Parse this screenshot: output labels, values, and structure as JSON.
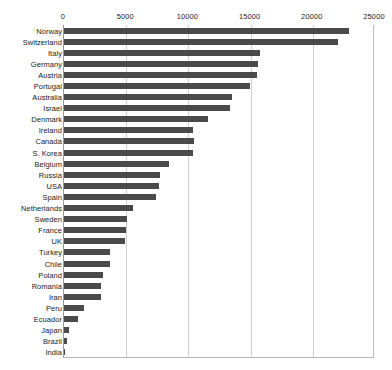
{
  "chart_data": {
    "type": "bar",
    "orientation": "horizontal",
    "title": "",
    "xlabel": "",
    "ylabel": "",
    "xlim": [
      0,
      25000
    ],
    "xticks": [
      0,
      5000,
      10000,
      15000,
      20000,
      25000
    ],
    "xtick_labels": [
      "0",
      "5000",
      "10000",
      "15000",
      "20000",
      "25000"
    ],
    "grid": true,
    "legend": false,
    "bar_color": "#4a4a4a",
    "background_color": "#ffffff",
    "gridline_color": "#cfcfcf",
    "categories": [
      "Norway",
      "Switzerland",
      "Italy",
      "Germany",
      "Austria",
      "Portugal",
      "Australia",
      "Israel",
      "Denmark",
      "Ireland",
      "Canada",
      "S. Korea",
      "Belgium",
      "Russia",
      "USA",
      "Spain",
      "Netherlands",
      "Sweden",
      "France",
      "UK",
      "Turkey",
      "Chile",
      "Poland",
      "Romania",
      "Iran",
      "Peru",
      "Ecuador",
      "Japan",
      "Brazil",
      "India"
    ],
    "values": [
      22900,
      22000,
      15750,
      15600,
      15500,
      14950,
      13500,
      13350,
      11600,
      10400,
      10450,
      10400,
      8450,
      7750,
      7650,
      7400,
      5550,
      5050,
      4950,
      4900,
      3700,
      3700,
      3150,
      2980,
      2950,
      1600,
      1150,
      400,
      280,
      120
    ]
  }
}
